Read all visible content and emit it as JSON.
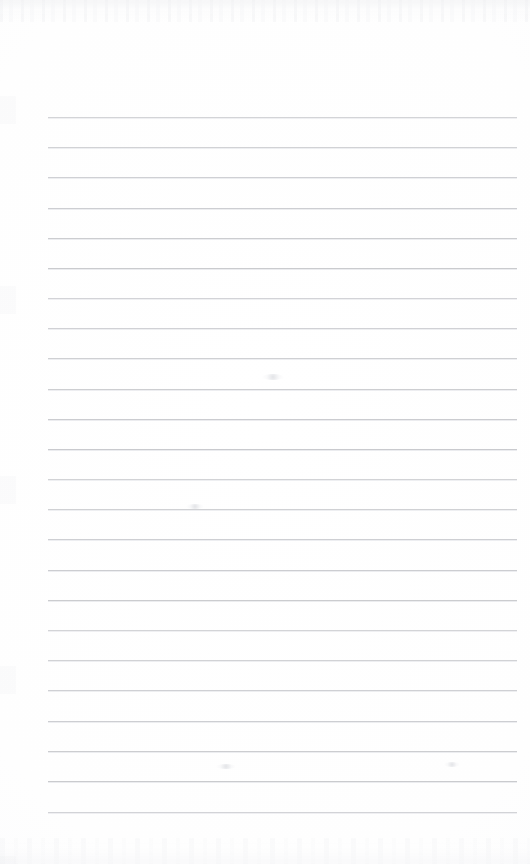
{
  "document": {
    "kind": "scanned-lined-paper",
    "title": "Blank Ruled Notebook Page",
    "description": "A scanned blank sheet of ruled writing paper with no handwriting or printed text.",
    "page_width": 530,
    "page_height": 864,
    "visible_text": "",
    "page_number": "",
    "header_text": "",
    "footer_text": ""
  },
  "paper": {
    "background_color": "#fefefe",
    "surface_tone": "#fcfcfd",
    "has_margin_rule": false,
    "has_holes": false,
    "has_header": false,
    "has_footer": false
  },
  "ruling": {
    "label": "Ruled lines",
    "line_color": "#c9cace",
    "line_soft_color": "#e4e5e9",
    "line_thickness_px": 1,
    "line_count": 24,
    "line_left_px": 48,
    "line_right_px": 517,
    "line_width_px": 469,
    "first_line_y_px": 117,
    "last_line_y_px": 812,
    "line_spacing_px": 30.2,
    "line_y_positions": [
      117,
      147,
      177,
      208,
      238,
      268,
      298,
      328,
      358,
      389,
      419,
      449,
      479,
      509,
      539,
      570,
      600,
      630,
      660,
      690,
      721,
      751,
      781,
      812
    ]
  },
  "artifacts": {
    "label": "Scan artifacts",
    "top_noise_band": true,
    "bottom_noise_band": true,
    "left_edge_marks": true,
    "smudges": [
      {
        "name": "smudge-upper-center",
        "x": 262,
        "y": 374,
        "w": 22,
        "h": 6
      },
      {
        "name": "smudge-mid-left",
        "x": 186,
        "y": 504,
        "w": 18,
        "h": 5
      },
      {
        "name": "smudge-lower-center",
        "x": 216,
        "y": 764,
        "w": 20,
        "h": 5
      },
      {
        "name": "smudge-right-lower",
        "x": 444,
        "y": 762,
        "w": 16,
        "h": 5
      }
    ]
  }
}
